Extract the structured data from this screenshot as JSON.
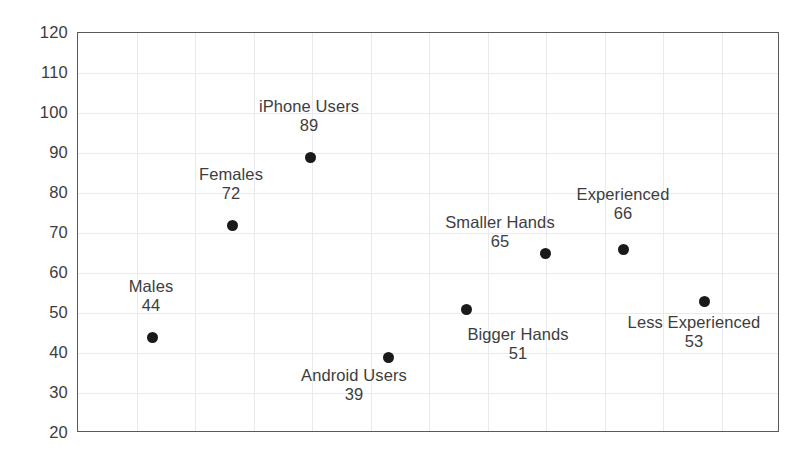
{
  "chart_data": {
    "type": "scatter",
    "title": "",
    "xlabel": "",
    "ylabel": "",
    "ylim": [
      20,
      120
    ],
    "ytick_step": 10,
    "yticks": [
      "120",
      "110",
      "100",
      "90",
      "80",
      "70",
      "60",
      "50",
      "40",
      "30",
      "20"
    ],
    "grid": "both",
    "legend": "none",
    "marker_color": "#1a1a1a",
    "frame_color": "#5a5a5a",
    "gridline_color": "#e9e9ef",
    "categories": [
      "Males",
      "Females",
      "iPhone Users",
      "Android Users",
      "Bigger Hands",
      "Smaller Hands",
      "Experienced",
      "Less Experienced"
    ],
    "values": [
      44,
      72,
      89,
      39,
      51,
      65,
      66,
      53
    ],
    "points": [
      {
        "name": "Males",
        "value": 44,
        "value_text": "44",
        "x_px": 151,
        "label_px_x": 151,
        "label_px_y": 277,
        "label_pos": "above"
      },
      {
        "name": "Females",
        "value": 72,
        "value_text": "72",
        "x_px": 231,
        "label_px_x": 231,
        "label_px_y": 165,
        "label_pos": "above"
      },
      {
        "name": "iPhone Users",
        "value": 89,
        "value_text": "89",
        "x_px": 309,
        "label_px_x": 309,
        "label_px_y": 97,
        "label_pos": "above"
      },
      {
        "name": "Android Users",
        "value": 39,
        "value_text": "39",
        "x_px": 387,
        "label_px_x": 354,
        "label_px_y": 366,
        "label_pos": "below"
      },
      {
        "name": "Bigger Hands",
        "value": 51,
        "value_text": "51",
        "x_px": 465,
        "label_px_x": 518,
        "label_px_y": 325,
        "label_pos": "below"
      },
      {
        "name": "Smaller Hands",
        "value": 65,
        "value_text": "65",
        "x_px": 544,
        "label_px_x": 500,
        "label_px_y": 213,
        "label_pos": "above-left"
      },
      {
        "name": "Experienced",
        "value": 66,
        "value_text": "66",
        "x_px": 622,
        "label_px_x": 623,
        "label_px_y": 185,
        "label_pos": "above"
      },
      {
        "name": "Less Experienced",
        "value": 53,
        "value_text": "53",
        "x_px": 703,
        "label_px_x": 694,
        "label_px_y": 313,
        "label_pos": "below"
      }
    ]
  }
}
